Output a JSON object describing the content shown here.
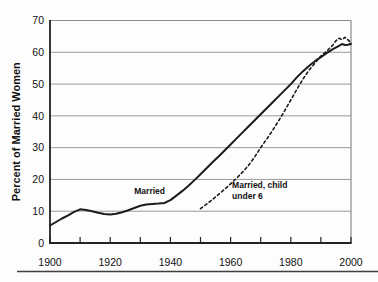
{
  "figure": {
    "title": ""
  },
  "colors": {
    "background": "#fdfdfd",
    "line": "#1c1c1c",
    "grid": "#9a9a9a",
    "frame": "#8c8c8c",
    "axis": "#222222",
    "text": "#111111",
    "separator": "#3f3f3f"
  },
  "chart_data": {
    "type": "line",
    "title": "",
    "xlabel": "",
    "ylabel": "Percent of Married Women",
    "xlim": [
      1900,
      2000
    ],
    "ylim": [
      0,
      70
    ],
    "grid": "horizontal",
    "legend_position": "inline-annotations",
    "y_ticks": [
      0,
      10,
      20,
      30,
      40,
      50,
      60,
      70
    ],
    "x_ticks": [
      1900,
      1910,
      1920,
      1930,
      1940,
      1950,
      1960,
      1970,
      1980,
      1990,
      2000
    ],
    "x_tick_labels": [
      {
        "x": 1900,
        "label": "1900"
      },
      {
        "x": 1920,
        "label": "1920"
      },
      {
        "x": 1940,
        "label": "1940"
      },
      {
        "x": 1960,
        "label": "1960"
      },
      {
        "x": 1980,
        "label": "1980"
      },
      {
        "x": 2000,
        "label": "2000"
      }
    ],
    "series": [
      {
        "name": "Married",
        "style": "solid",
        "width": 2,
        "points": [
          [
            1900,
            5.5
          ],
          [
            1902,
            6.6
          ],
          [
            1904,
            7.7
          ],
          [
            1906,
            8.7
          ],
          [
            1908,
            9.8
          ],
          [
            1910,
            10.6
          ],
          [
            1912,
            10.4
          ],
          [
            1914,
            10.0
          ],
          [
            1916,
            9.5
          ],
          [
            1918,
            9.1
          ],
          [
            1920,
            9.0
          ],
          [
            1922,
            9.2
          ],
          [
            1924,
            9.7
          ],
          [
            1926,
            10.3
          ],
          [
            1928,
            11.0
          ],
          [
            1930,
            11.7
          ],
          [
            1932,
            12.1
          ],
          [
            1934,
            12.3
          ],
          [
            1936,
            12.4
          ],
          [
            1938,
            12.6
          ],
          [
            1940,
            13.5
          ],
          [
            1942,
            14.9
          ],
          [
            1944,
            16.4
          ],
          [
            1946,
            18.0
          ],
          [
            1948,
            19.8
          ],
          [
            1950,
            21.6
          ],
          [
            1952,
            23.5
          ],
          [
            1954,
            25.4
          ],
          [
            1956,
            27.2
          ],
          [
            1958,
            29.1
          ],
          [
            1960,
            31.0
          ],
          [
            1962,
            32.9
          ],
          [
            1964,
            34.8
          ],
          [
            1966,
            36.7
          ],
          [
            1968,
            38.6
          ],
          [
            1970,
            40.5
          ],
          [
            1972,
            42.4
          ],
          [
            1974,
            44.3
          ],
          [
            1976,
            46.2
          ],
          [
            1978,
            48.1
          ],
          [
            1980,
            50.0
          ],
          [
            1982,
            52.1
          ],
          [
            1984,
            54.0
          ],
          [
            1986,
            55.7
          ],
          [
            1988,
            57.2
          ],
          [
            1990,
            58.5
          ],
          [
            1992,
            59.8
          ],
          [
            1994,
            61.0
          ],
          [
            1996,
            62.0
          ],
          [
            1997,
            62.6
          ],
          [
            1998,
            62.3
          ],
          [
            1999,
            62.4
          ],
          [
            2000,
            62.7
          ]
        ]
      },
      {
        "name": "Married, child under 6",
        "style": "dashed",
        "width": 1.6,
        "points": [
          [
            1950,
            10.8
          ],
          [
            1952,
            12.2
          ],
          [
            1954,
            13.7
          ],
          [
            1956,
            15.3
          ],
          [
            1958,
            16.9
          ],
          [
            1960,
            18.6
          ],
          [
            1962,
            20.4
          ],
          [
            1964,
            22.3
          ],
          [
            1966,
            24.5
          ],
          [
            1968,
            27.1
          ],
          [
            1970,
            30.0
          ],
          [
            1972,
            32.7
          ],
          [
            1974,
            35.5
          ],
          [
            1976,
            38.5
          ],
          [
            1978,
            41.7
          ],
          [
            1980,
            45.0
          ],
          [
            1982,
            48.3
          ],
          [
            1984,
            51.5
          ],
          [
            1986,
            54.3
          ],
          [
            1988,
            56.6
          ],
          [
            1990,
            58.8
          ],
          [
            1992,
            60.4
          ],
          [
            1994,
            62.3
          ],
          [
            1995,
            63.6
          ],
          [
            1996,
            64.4
          ],
          [
            1997,
            64.0
          ],
          [
            1998,
            64.7
          ],
          [
            1999,
            63.9
          ],
          [
            2000,
            63.0
          ]
        ]
      }
    ],
    "annotations": [
      {
        "name": "label-married",
        "lines": [
          "Married"
        ],
        "x": 1928,
        "y": 15.5
      },
      {
        "name": "label-married-child-under-6",
        "lines": [
          "Married, child",
          "under 6"
        ],
        "x": 1960.5,
        "y": 17.3
      }
    ]
  }
}
